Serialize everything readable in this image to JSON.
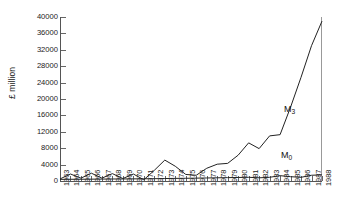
{
  "chart_data": {
    "type": "line",
    "title": "",
    "xlabel": "",
    "ylabel": "£ million",
    "ylim": [
      0,
      40000
    ],
    "yticks": [
      0,
      4000,
      8000,
      12000,
      16000,
      20000,
      24000,
      28000,
      32000,
      36000,
      40000
    ],
    "ytick_labels": [
      "0",
      "4000",
      "8000",
      "12000",
      "16000",
      "20000",
      "24000",
      "28000",
      "32000",
      "36000",
      "40000"
    ],
    "grid": false,
    "legend_position": "inline-annotation",
    "x": [
      1963,
      1964,
      1965,
      1966,
      1967,
      1968,
      1969,
      1970,
      1971,
      1972,
      1973,
      1974,
      1975,
      1976,
      1977,
      1978,
      1979,
      1980,
      1981,
      1982,
      1983,
      1984,
      1985,
      1986,
      1987,
      1988
    ],
    "xtick_labels": [
      "1963",
      "1964",
      "1965",
      "1966",
      "1967",
      "1968",
      "1969",
      "1970",
      "1971",
      "1972",
      "1973",
      "1974",
      "1975",
      "1976",
      "1977",
      "1978",
      "1979",
      "1980",
      "1981",
      "1982",
      "1983",
      "1984",
      "1985",
      "1986",
      "1987",
      "1988"
    ],
    "series": [
      {
        "name": "M3",
        "label": "M",
        "sub": "3",
        "color": "#222222",
        "values": [
          500,
          1700,
          700,
          1900,
          700,
          1800,
          600,
          1700,
          300,
          2600,
          5100,
          3600,
          1600,
          1400,
          3100,
          4100,
          4300,
          6300,
          9300,
          7900,
          11000,
          11300,
          18000,
          25300,
          33000,
          39000
        ]
      },
      {
        "name": "M0",
        "label": "M",
        "sub": "0",
        "color": "#222222",
        "values": [
          400,
          420,
          430,
          450,
          470,
          490,
          500,
          520,
          540,
          560,
          600,
          640,
          660,
          700,
          740,
          780,
          820,
          860,
          900,
          780,
          900,
          1300,
          1050,
          900,
          1400,
          1500
        ]
      }
    ],
    "annotations": [
      {
        "text": "M",
        "sub": "3",
        "x_px": 284,
        "y_px": 104
      },
      {
        "text": "M",
        "sub": "0",
        "x_px": 281,
        "y_px": 150
      }
    ]
  },
  "axes": {
    "plot_left_px": 60,
    "plot_right_px": 322,
    "plot_top_px": 17,
    "plot_bottom_px": 181
  }
}
